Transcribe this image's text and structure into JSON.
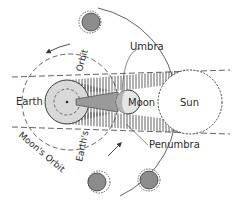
{
  "diagram": {
    "labels": {
      "umbra": "Umbra",
      "earth": "Earth",
      "moon": "Moon",
      "sun": "Sun",
      "penumbra": "Penumbra",
      "orbit": "Orbit",
      "moons_orbit": "Moon's Orbit",
      "earths": "Earth's"
    },
    "colors": {
      "line": "#3a3a3a",
      "earth_fill": "#d9d9d9",
      "moon_fill": "#e6e6e6",
      "umbra_fill": "#9a9a9a",
      "small_body_fill": "#8c8c8c",
      "background": "#ffffff"
    },
    "bodies": [
      {
        "name": "earth",
        "cx": 67,
        "cy": 102,
        "r": 22
      },
      {
        "name": "moon",
        "cx": 128,
        "cy": 102,
        "r": 12
      },
      {
        "name": "sun",
        "cx": 190,
        "cy": 102,
        "r": 32
      },
      {
        "name": "phase-top",
        "cx": 90,
        "cy": 22,
        "r": 10
      },
      {
        "name": "phase-bottom-left",
        "cx": 97,
        "cy": 182,
        "r": 10
      },
      {
        "name": "phase-bottom-right",
        "cx": 149,
        "cy": 180,
        "r": 10
      }
    ]
  }
}
